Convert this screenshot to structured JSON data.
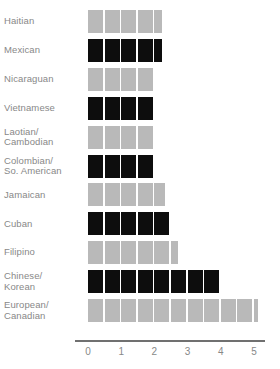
{
  "chart_data": {
    "type": "bar",
    "title": "",
    "subtitle": "",
    "xlabel": "",
    "ylabel": "",
    "orientation": "horizontal",
    "xlim": [
      0,
      5.6
    ],
    "xticks": [
      0,
      1,
      2,
      3,
      4,
      5
    ],
    "xticklabels": [
      "0",
      "1",
      "2",
      "3",
      "4",
      "5"
    ],
    "grid": false,
    "legend": null,
    "block_unit": 0.5,
    "colors": {
      "dark": "#0d0d0d",
      "light": "#b9b9b9",
      "axis": "#707070",
      "text": "#888888"
    },
    "categories": [
      "Haitian",
      "Mexican",
      "Nicaraguan",
      "Vietnamese",
      "Laotian/\nCambodian",
      "Colombian/\nSo. American",
      "Jamaican",
      "Cuban",
      "Filipino",
      "Chinese/\nKorean",
      "European/\nCanadian"
    ],
    "values": [
      2.25,
      2.25,
      2.0,
      2.0,
      2.0,
      2.0,
      2.35,
      2.5,
      2.75,
      4.0,
      5.15
    ],
    "bars": [
      {
        "label": "Haitian",
        "label_lines": [
          "Haitian"
        ],
        "value": 2.25,
        "shade": "light",
        "full_blocks": 4,
        "partial": 0.5
      },
      {
        "label": "Mexican",
        "label_lines": [
          "Mexican"
        ],
        "value": 2.25,
        "shade": "dark",
        "full_blocks": 4,
        "partial": 0.5
      },
      {
        "label": "Nicaraguan",
        "label_lines": [
          "Nicaraguan"
        ],
        "value": 2.0,
        "shade": "light",
        "full_blocks": 4,
        "partial": 0
      },
      {
        "label": "Vietnamese",
        "label_lines": [
          "Vietnamese"
        ],
        "value": 2.0,
        "shade": "dark",
        "full_blocks": 4,
        "partial": 0
      },
      {
        "label": "Laotian/ Cambodian",
        "label_lines": [
          "Laotian/",
          "Cambodian"
        ],
        "value": 2.0,
        "shade": "light",
        "full_blocks": 4,
        "partial": 0
      },
      {
        "label": "Colombian/ So. American",
        "label_lines": [
          "Colombian/",
          "So. American"
        ],
        "value": 2.0,
        "shade": "dark",
        "full_blocks": 4,
        "partial": 0
      },
      {
        "label": "Jamaican",
        "label_lines": [
          "Jamaican"
        ],
        "value": 2.35,
        "shade": "light",
        "full_blocks": 4,
        "partial": 0.7
      },
      {
        "label": "Cuban",
        "label_lines": [
          "Cuban"
        ],
        "value": 2.5,
        "shade": "dark",
        "full_blocks": 5,
        "partial": 0
      },
      {
        "label": "Filipino",
        "label_lines": [
          "Filipino"
        ],
        "value": 2.75,
        "shade": "light",
        "full_blocks": 5,
        "partial": 0.5
      },
      {
        "label": "Chinese/ Korean",
        "label_lines": [
          "Chinese/",
          "Korean"
        ],
        "value": 4.0,
        "shade": "dark",
        "full_blocks": 8,
        "partial": 0
      },
      {
        "label": "European/ Canadian",
        "label_lines": [
          "European/",
          "Canadian"
        ],
        "value": 5.15,
        "shade": "light",
        "full_blocks": 10,
        "partial": 0.3
      }
    ]
  }
}
